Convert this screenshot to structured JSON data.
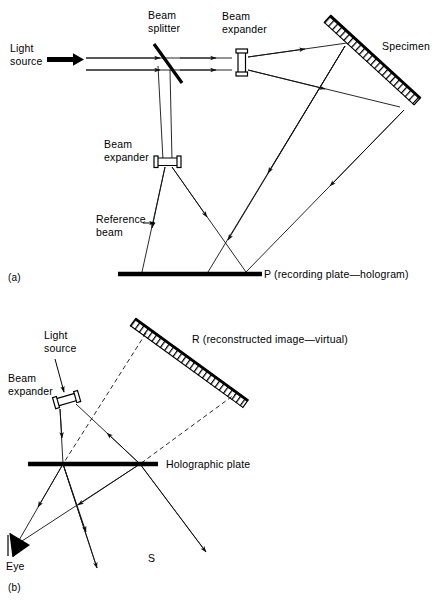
{
  "figure": {
    "panels": [
      {
        "id": "a",
        "label": "(a)",
        "caption": "Recording the hologram",
        "labels": {
          "light_source": "Light\nsource",
          "light_source_line1": "Light",
          "light_source_line2": "source",
          "beam_splitter_line1": "Beam",
          "beam_splitter_line2": "splitter",
          "beam_expander_top_line1": "Beam",
          "beam_expander_top_line2": "expander",
          "beam_expander_ref_line1": "Beam",
          "beam_expander_ref_line2": "expander",
          "reference_beam_line1": "Reference",
          "reference_beam_line2": "beam",
          "specimen": "Specimen",
          "recording_plate": "P (recording plate—hologram)"
        }
      },
      {
        "id": "b",
        "label": "(b)",
        "caption": "Reconstructing the virtual image",
        "labels": {
          "light_source_line1": "Light",
          "light_source_line2": "source",
          "beam_expander_line1": "Beam",
          "beam_expander_line2": "expander",
          "reconstructed_image": "R (reconstructed image—virtual)",
          "holographic_plate": "Holographic plate",
          "eye": "Eye",
          "s_marker": "S"
        }
      }
    ],
    "colors": {
      "ink": "#000000",
      "background": "#ffffff",
      "ray": "#111111"
    }
  }
}
